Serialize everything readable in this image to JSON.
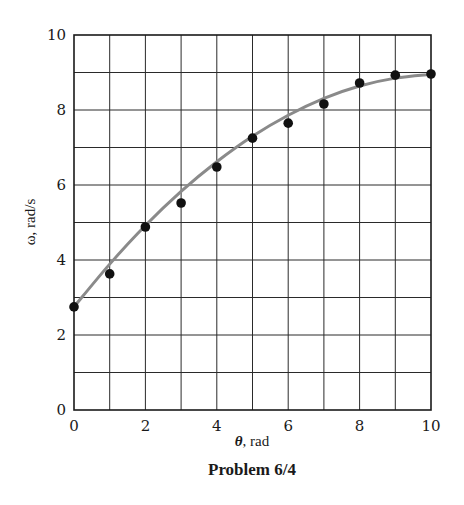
{
  "chart_data": {
    "type": "scatter",
    "title": "",
    "caption": "Problem 6/4",
    "xlabel_symbol": "θ",
    "xlabel_unit": ", rad",
    "ylabel": "ω, rad/s",
    "xlim": [
      0,
      10
    ],
    "ylim": [
      0,
      10
    ],
    "grid": true,
    "x_ticks": [
      0,
      2,
      4,
      6,
      8,
      10
    ],
    "y_ticks": [
      0,
      2,
      4,
      6,
      8,
      10
    ],
    "x_grid_step": 1,
    "y_grid_step": 1,
    "series": [
      {
        "name": "measured",
        "kind": "points",
        "x": [
          0,
          1,
          2,
          3,
          4,
          5,
          6,
          7,
          8,
          9,
          10
        ],
        "y": [
          2.75,
          3.63,
          4.88,
          5.52,
          6.48,
          7.25,
          7.65,
          8.16,
          8.72,
          8.93,
          8.96
        ]
      },
      {
        "name": "fitted curve",
        "kind": "line",
        "x": [
          0,
          1,
          2,
          3,
          4,
          5,
          6,
          7,
          8,
          9,
          10
        ],
        "y": [
          2.75,
          3.89,
          4.92,
          5.83,
          6.62,
          7.3,
          7.86,
          8.31,
          8.64,
          8.85,
          8.95
        ]
      }
    ],
    "colors": {
      "axis": "#1a1a1a",
      "grid": "#2a2a2a",
      "points": "#111111",
      "curve": "#8a8a8a"
    }
  }
}
